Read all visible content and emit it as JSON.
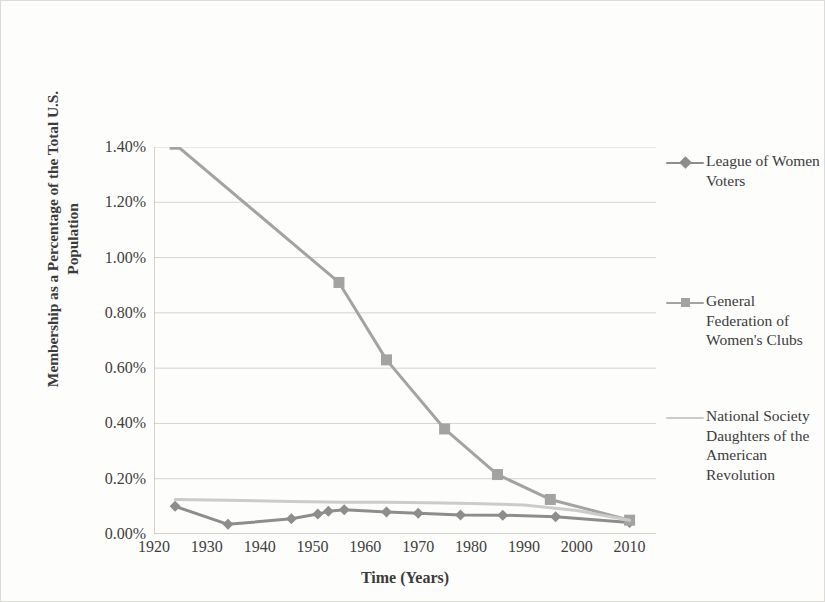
{
  "chart_data": {
    "type": "line",
    "title": "",
    "xlabel": "Time (Years)",
    "ylabel": "Membership as a Percentage of the Total U.S. Population",
    "xlim": [
      1920,
      2015
    ],
    "ylim": [
      0.0,
      1.4
    ],
    "xticks": [
      1920,
      1930,
      1940,
      1950,
      1960,
      1970,
      1980,
      1990,
      2000,
      2010
    ],
    "xtick_labels": [
      "1920",
      "1930",
      "1940",
      "1950",
      "1960",
      "1970",
      "1980",
      "1990",
      "2000",
      "2010"
    ],
    "yticks": [
      0.0,
      0.2,
      0.4,
      0.6,
      0.8,
      1.0,
      1.2,
      1.4
    ],
    "ytick_labels": [
      "0.00%",
      "0.20%",
      "0.40%",
      "0.60%",
      "0.80%",
      "1.00%",
      "1.20%",
      "1.40%"
    ],
    "grid": "horizontal",
    "legend_position": "right",
    "series": [
      {
        "name": "League of Women Voters",
        "color": "#8d8d8d",
        "marker": "diamond",
        "points": [
          [
            1924,
            0.1
          ],
          [
            1934,
            0.035
          ],
          [
            1946,
            0.055
          ],
          [
            1951,
            0.072
          ],
          [
            1953,
            0.082
          ],
          [
            1956,
            0.088
          ],
          [
            1964,
            0.08
          ],
          [
            1970,
            0.075
          ],
          [
            1978,
            0.069
          ],
          [
            1986,
            0.068
          ],
          [
            1996,
            0.062
          ],
          [
            2010,
            0.042
          ]
        ]
      },
      {
        "name": "General Federation of Women's Clubs",
        "color": "#a3a3a3",
        "marker": "square",
        "points": [
          [
            1924,
            1.41
          ],
          [
            1955,
            0.91
          ],
          [
            1964,
            0.63
          ],
          [
            1975,
            0.38
          ],
          [
            1985,
            0.215
          ],
          [
            1995,
            0.125
          ],
          [
            2010,
            0.05
          ]
        ]
      },
      {
        "name": "National Society Daughters of the American Revolution",
        "color": "#cbcbc9",
        "marker": "none",
        "points": [
          [
            1924,
            0.125
          ],
          [
            1934,
            0.122
          ],
          [
            1946,
            0.118
          ],
          [
            1956,
            0.115
          ],
          [
            1964,
            0.115
          ],
          [
            1972,
            0.113
          ],
          [
            1980,
            0.11
          ],
          [
            1990,
            0.105
          ],
          [
            2000,
            0.085
          ],
          [
            2010,
            0.05
          ]
        ]
      }
    ]
  },
  "legend": {
    "items": [
      {
        "label": "League of Women Voters",
        "color": "#8d8d8d",
        "marker": "diamond"
      },
      {
        "label": "General Federation of Women's Clubs",
        "color": "#a3a3a3",
        "marker": "square"
      },
      {
        "label": "National Society Daughters of the American Revolution",
        "color": "#cbcbc9",
        "marker": "none"
      }
    ]
  },
  "style": {
    "background": "#fdfdfb",
    "border_color": "#dddbd6",
    "grid_color": "#d6d4d0",
    "axis_color": "#b9b7b3",
    "text_color": "#3b3b3b"
  }
}
